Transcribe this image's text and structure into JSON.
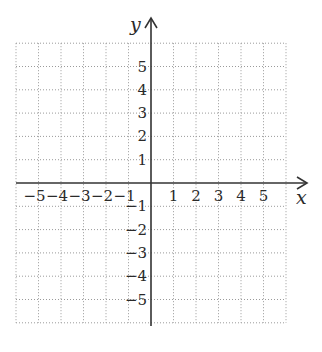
{
  "chart_data": {
    "type": "scatter",
    "title": "",
    "xlabel": "x",
    "ylabel": "y",
    "xlim": [
      -6,
      6
    ],
    "ylim": [
      -6,
      6
    ],
    "grid": true,
    "grid_style": "dotted",
    "x_ticks": [
      -5,
      -4,
      -3,
      -2,
      -1,
      1,
      2,
      3,
      4,
      5
    ],
    "y_ticks": [
      5,
      4,
      3,
      2,
      1,
      -1,
      -2,
      -3,
      -4,
      -5
    ],
    "x_tick_labels": [
      "−5",
      "−4",
      "−3",
      "−2",
      "−1",
      "1",
      "2",
      "3",
      "4",
      "5"
    ],
    "y_tick_labels": [
      "5",
      "4",
      "3",
      "2",
      "1",
      "−1",
      "−2",
      "−3",
      "−4",
      "−5"
    ],
    "series": [],
    "legend": null,
    "colors": {
      "axis": "#333333",
      "grid": "#9a9a9a",
      "text": "#2a2a2a"
    }
  },
  "labels": {
    "x_axis": "x",
    "y_axis": "y"
  }
}
